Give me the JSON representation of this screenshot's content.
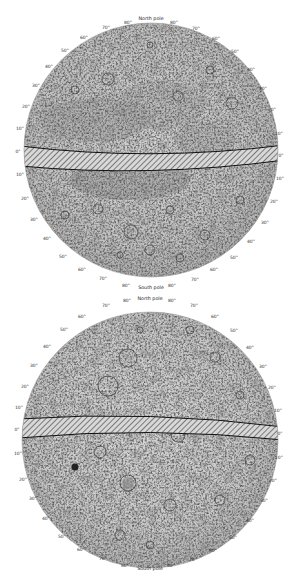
{
  "figure": {
    "colors": {
      "background": "#ffffff",
      "surface_light": "#d9d9d9",
      "surface_mid": "#b8b8b8",
      "surface_dark": "#8c8c8c",
      "line": "#1a1a1a",
      "label": "#333333"
    }
  },
  "top_map": {
    "north_label": "North pole",
    "south_label": "South pole",
    "top_ticks": [
      "70°",
      "80°",
      "80°",
      "70°"
    ],
    "left_ticks": [
      "60°",
      "50°",
      "40°",
      "30°",
      "20°",
      "10°",
      "0°",
      "10°",
      "20°",
      "30°",
      "40°",
      "50°",
      "60°"
    ],
    "right_ticks": [
      "60°",
      "50°",
      "40°",
      "30°",
      "20°",
      "10°",
      "0°",
      "10°",
      "20°",
      "30°",
      "40°",
      "50°",
      "60°"
    ],
    "bottom_ticks": [
      "70°",
      "80°",
      "80°",
      "70°"
    ]
  },
  "bottom_map": {
    "north_label": "North pole",
    "south_label": "South pole",
    "top_ticks": [
      "70°",
      "80°",
      "80°",
      "70°"
    ],
    "left_ticks": [
      "60°",
      "50°",
      "40°",
      "30°",
      "20°",
      "10°",
      "0°",
      "10°",
      "20°",
      "30°",
      "40°",
      "50°",
      "60°"
    ],
    "right_ticks": [
      "60°",
      "50°",
      "40°",
      "30°",
      "20°",
      "10°",
      "0°",
      "10°",
      "20°",
      "30°",
      "40°",
      "50°",
      "60°"
    ],
    "bottom_ticks": [
      "70°",
      "80°",
      "80°",
      "70°"
    ]
  }
}
